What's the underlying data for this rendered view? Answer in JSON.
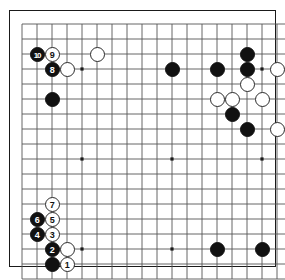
{
  "board": {
    "title": "Go game diagram",
    "size": 19,
    "columns": 19,
    "rows": 18,
    "grid_spacing_px": 15,
    "origin_x_px": 22,
    "origin_y_px": 24,
    "colors": {
      "background": "#ffffff",
      "line": "#555555",
      "border": "#1a1a1a",
      "black_stone": "#111111",
      "white_stone": "#ffffff",
      "white_stone_edge": "#2b2b2b",
      "star_point": "#1a1a1a"
    },
    "star_points": [
      {
        "col": 4,
        "row": 3
      },
      {
        "col": 10,
        "row": 3
      },
      {
        "col": 16,
        "row": 3
      },
      {
        "col": 4,
        "row": 9
      },
      {
        "col": 10,
        "row": 9
      },
      {
        "col": 16,
        "row": 9
      },
      {
        "col": 4,
        "row": 15
      },
      {
        "col": 10,
        "row": 15
      },
      {
        "col": 16,
        "row": 15
      }
    ],
    "stones": [
      {
        "id": "s-b-10",
        "color": "black",
        "label": "10",
        "col": 1,
        "row": 2
      },
      {
        "id": "s-w-9",
        "color": "white",
        "label": "9",
        "col": 2,
        "row": 2
      },
      {
        "id": "s-b-8",
        "color": "black",
        "label": "8",
        "col": 2,
        "row": 3
      },
      {
        "id": "s-w-c3",
        "color": "white",
        "label": "",
        "col": 3,
        "row": 3
      },
      {
        "id": "s-w-c6r2",
        "color": "white",
        "label": "",
        "col": 5,
        "row": 2
      },
      {
        "id": "s-b-c2r5",
        "color": "black",
        "label": "",
        "col": 2,
        "row": 5
      },
      {
        "id": "s-b-c10r3",
        "color": "black",
        "label": "",
        "col": 10,
        "row": 3
      },
      {
        "id": "s-b-c13r3",
        "color": "black",
        "label": "",
        "col": 13,
        "row": 3
      },
      {
        "id": "s-b-c15r2",
        "color": "black",
        "label": "",
        "col": 15,
        "row": 2
      },
      {
        "id": "s-b-c15r3",
        "color": "black",
        "label": "",
        "col": 15,
        "row": 3
      },
      {
        "id": "s-w-c17r3",
        "color": "white",
        "label": "",
        "col": 17,
        "row": 3
      },
      {
        "id": "s-w-c15r4",
        "color": "white",
        "label": "",
        "col": 15,
        "row": 4
      },
      {
        "id": "s-w-c13r5",
        "color": "white",
        "label": "",
        "col": 13,
        "row": 5
      },
      {
        "id": "s-w-c14r5",
        "color": "white",
        "label": "",
        "col": 14,
        "row": 5
      },
      {
        "id": "s-w-c16r5",
        "color": "white",
        "label": "",
        "col": 16,
        "row": 5
      },
      {
        "id": "s-b-c14r6",
        "color": "black",
        "label": "",
        "col": 14,
        "row": 6
      },
      {
        "id": "s-b-c15r7",
        "color": "black",
        "label": "",
        "col": 15,
        "row": 7
      },
      {
        "id": "s-w-c17r7",
        "color": "white",
        "label": "",
        "col": 17,
        "row": 7
      },
      {
        "id": "s-w-7",
        "color": "white",
        "label": "7",
        "col": 2,
        "row": 12
      },
      {
        "id": "s-b-6",
        "color": "black",
        "label": "6",
        "col": 1,
        "row": 13
      },
      {
        "id": "s-w-5",
        "color": "white",
        "label": "5",
        "col": 2,
        "row": 13
      },
      {
        "id": "s-b-4",
        "color": "black",
        "label": "4",
        "col": 1,
        "row": 14
      },
      {
        "id": "s-w-3",
        "color": "white",
        "label": "3",
        "col": 2,
        "row": 14
      },
      {
        "id": "s-b-2",
        "color": "black",
        "label": "2",
        "col": 2,
        "row": 15
      },
      {
        "id": "s-w-c3r15",
        "color": "white",
        "label": "",
        "col": 3,
        "row": 15
      },
      {
        "id": "s-b-c2r16",
        "color": "black",
        "label": "",
        "col": 2,
        "row": 16
      },
      {
        "id": "s-w-1",
        "color": "white",
        "label": "1",
        "col": 3,
        "row": 16
      },
      {
        "id": "s-b-c13r15",
        "color": "black",
        "label": "",
        "col": 13,
        "row": 15
      },
      {
        "id": "s-b-c16r15",
        "color": "black",
        "label": "",
        "col": 16,
        "row": 15
      }
    ],
    "move_sequence": [
      "1",
      "2",
      "3",
      "4",
      "5",
      "6",
      "7",
      "8",
      "9",
      "10"
    ]
  }
}
